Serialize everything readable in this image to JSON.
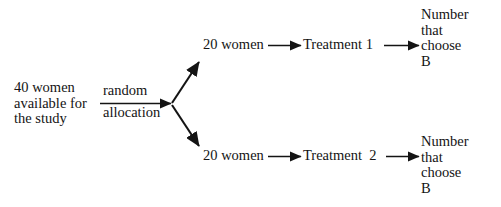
{
  "diagram": {
    "type": "flow-diagram",
    "background_color": "#ffffff",
    "text_color": "#141414",
    "nodes": {
      "source": "40 women\navailable for\nthe study",
      "allocation_top": "random",
      "allocation_bottom": "allocation",
      "group_1": "20 women",
      "group_2": "20 women",
      "treatment_1": "Treatment 1",
      "treatment_2": "Treatment  2",
      "outcome_1": "Number\nthat\nchoose\nB",
      "outcome_2": "Number\nthat\nchoose\nB"
    },
    "arrows": [
      {
        "name": "allocation-arrow",
        "from": "source",
        "to": "split-node",
        "direction": "right"
      },
      {
        "name": "branch-up-arrow",
        "from": "split-node",
        "to": "group_1",
        "direction": "up-right"
      },
      {
        "name": "branch-down-arrow",
        "from": "split-node",
        "to": "group_2",
        "direction": "down-right"
      },
      {
        "name": "group1-to-treatment1-arrow",
        "from": "group_1",
        "to": "treatment_1",
        "direction": "right"
      },
      {
        "name": "treatment1-to-outcome1-arrow",
        "from": "treatment_1",
        "to": "outcome_1",
        "direction": "right"
      },
      {
        "name": "group2-to-treatment2-arrow",
        "from": "group_2",
        "to": "treatment_2",
        "direction": "right"
      },
      {
        "name": "treatment2-to-outcome2-arrow",
        "from": "treatment_2",
        "to": "outcome_2",
        "direction": "right"
      }
    ]
  }
}
